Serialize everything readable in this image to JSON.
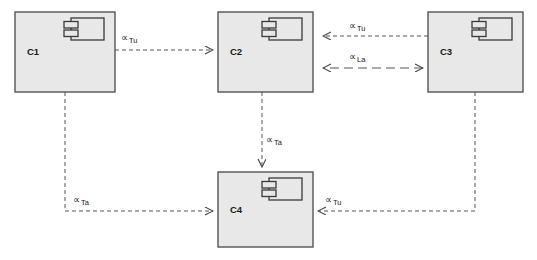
{
  "diagram": {
    "type": "uml-component-diagram",
    "width": 537,
    "height": 260,
    "background_color": "#ffffff",
    "box_fill_color": "#e8e8e8",
    "box_stroke_color": "#555555",
    "line_color": "#555555",
    "text_color": "#1a1a1a"
  },
  "components": [
    {
      "id": "c1",
      "label": "C1",
      "x": 15,
      "y": 12,
      "width": 100,
      "height": 80,
      "label_x": 27,
      "label_y": 55,
      "icon_x": 64,
      "icon_y": 18
    },
    {
      "id": "c2",
      "label": "C2",
      "x": 218,
      "y": 12,
      "width": 95,
      "height": 80,
      "label_x": 230,
      "label_y": 55,
      "icon_x": 262,
      "icon_y": 18
    },
    {
      "id": "c3",
      "label": "C3",
      "x": 428,
      "y": 12,
      "width": 95,
      "height": 80,
      "label_x": 440,
      "label_y": 55,
      "icon_x": 472,
      "icon_y": 18
    },
    {
      "id": "c4",
      "label": "C4",
      "x": 218,
      "y": 172,
      "width": 95,
      "height": 75,
      "label_x": 230,
      "label_y": 213,
      "icon_x": 262,
      "icon_y": 178
    }
  ],
  "connections": [
    {
      "id": "c1-to-c2",
      "from": "C1",
      "to": "C2",
      "stereotype_symbol": "∝",
      "stereotype_subscript": "Tu",
      "style": "dashed",
      "arrow_ends": "target",
      "path": "M 115 50 L 213 50",
      "label_x": 121,
      "label_y": 41,
      "sub_dx": 8,
      "sub_dy": 2
    },
    {
      "id": "c3-to-c2-tu",
      "from": "C3",
      "to": "C2",
      "stereotype_symbol": "∝",
      "stereotype_subscript": "Tu",
      "style": "dashed",
      "arrow_ends": "target",
      "path": "M 428 36 L 323 36",
      "label_x": 349,
      "label_y": 29,
      "sub_dx": 8,
      "sub_dy": 2
    },
    {
      "id": "c3-to-c2-la",
      "from": "C3",
      "to": "C2",
      "stereotype_symbol": "∝",
      "stereotype_subscript": "La",
      "style": "dashed-long",
      "arrow_ends": "both",
      "path": "M 423 68 L 323 68",
      "label_x": 349,
      "label_y": 60,
      "sub_dx": 8,
      "sub_dy": 2
    },
    {
      "id": "c2-to-c4",
      "from": "C2",
      "to": "C4",
      "stereotype_symbol": "∝",
      "stereotype_subscript": "Ta",
      "style": "dashed",
      "arrow_ends": "target",
      "path": "M 262 92 L 262 167",
      "label_x": 266,
      "label_y": 143,
      "sub_dx": 8,
      "sub_dy": 2
    },
    {
      "id": "c1-to-c4",
      "from": "C1",
      "to": "C4",
      "stereotype_symbol": "∝",
      "stereotype_subscript": "Ta",
      "style": "dashed",
      "arrow_ends": "target",
      "path": "M 65 92 L 65 211 L 213 211",
      "label_x": 73,
      "label_y": 203,
      "sub_dx": 8,
      "sub_dy": 2
    },
    {
      "id": "c3-to-c4",
      "from": "C3",
      "to": "C4",
      "stereotype_symbol": "∝",
      "stereotype_subscript": "Tu",
      "style": "dashed",
      "arrow_ends": "target",
      "path": "M 475 92 L 475 211 L 318 211",
      "label_x": 325,
      "label_y": 203,
      "sub_dx": 8,
      "sub_dy": 2
    }
  ],
  "caption": {
    "text": "",
    "x": 6,
    "y": 255
  }
}
